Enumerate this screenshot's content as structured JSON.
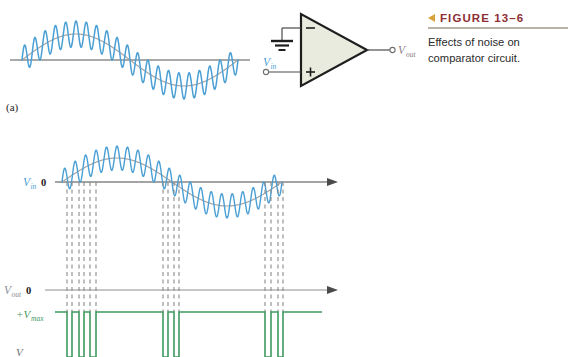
{
  "figure": {
    "marker_icon": "left-triangle-icon",
    "label": "FIGURE 13–6",
    "caption": "Effects of noise on comparator circuit.",
    "label_color": "#8f2f35",
    "marker_color": "#d8a23c"
  },
  "part_labels": {
    "a": "(a)"
  },
  "colors": {
    "noise_wave": "#4a9fd4",
    "ideal_sine": "#9b9b9b",
    "axis": "#6f6f6f",
    "output_wave": "#3f9a5f",
    "opamp_fill": "#e9ebdf",
    "opamp_stroke": "#1e1e1e",
    "vin_label": "#4a9fd4",
    "vout_label": "#8d7f86",
    "vmax_label": "#3f9a5f",
    "dashed": "#8a8a8a"
  },
  "circuit": {
    "title": "comparator-circuit",
    "input_label": "V",
    "input_sub": "in",
    "output_label": "V",
    "output_sub": "out",
    "inverting_symbol": "−",
    "noninverting_symbol": "+",
    "ground_symbol": "ground-icon"
  },
  "plot_top": {
    "name": "noisy-sine-input-waveform",
    "axis_label": "",
    "zero_label": ""
  },
  "plot_bottom": {
    "name": "comparator-input-output-timing",
    "vin_label": "V",
    "vin_sub": "in",
    "vin_zero": "0",
    "vout_label": "V",
    "vout_sub": "out",
    "vout_zero": "0",
    "vmax_label": "+V",
    "vmax_sub": "max",
    "vmin_label": "V"
  },
  "chart_data": {
    "type": "line",
    "title": "Effects of noise on comparator circuit.",
    "xlabel": "",
    "ylabel": "",
    "charts": [
      {
        "id": "top-waveform",
        "series": [
          {
            "name": "ideal sine",
            "color": "#9b9b9b",
            "amplitude": 26,
            "periods": 1,
            "phase": 0
          },
          {
            "name": "sine with noise",
            "color": "#4a9fd4",
            "amplitude": 26,
            "periods": 1,
            "noise_amplitude": 13,
            "noise_periods": 21
          }
        ],
        "axis": {
          "zero_line": true,
          "color": "#6f6f6f"
        }
      },
      {
        "id": "bottom-input",
        "series": [
          {
            "name": "ideal sine",
            "color": "#9b9b9b",
            "amplitude": 24,
            "periods": 1,
            "phase": 0
          },
          {
            "name": "sine with noise",
            "color": "#4a9fd4",
            "amplitude": 24,
            "periods": 1,
            "noise_amplitude": 12,
            "noise_periods": 21
          }
        ],
        "axis": {
          "zero_line": true,
          "arrow": true,
          "color": "#4a4a4a"
        }
      },
      {
        "id": "bottom-output",
        "type": "square",
        "color": "#3f9a5f",
        "levels": [
          "+Vmax",
          "0",
          "-Vmax"
        ],
        "transitions_x": [
          67,
          72,
          79,
          84,
          90,
          96,
          163,
          168,
          174,
          179,
          265,
          271,
          278,
          283
        ],
        "axis": {
          "zero_line": true,
          "arrow": true,
          "color": "#4a4a4a"
        }
      }
    ]
  }
}
